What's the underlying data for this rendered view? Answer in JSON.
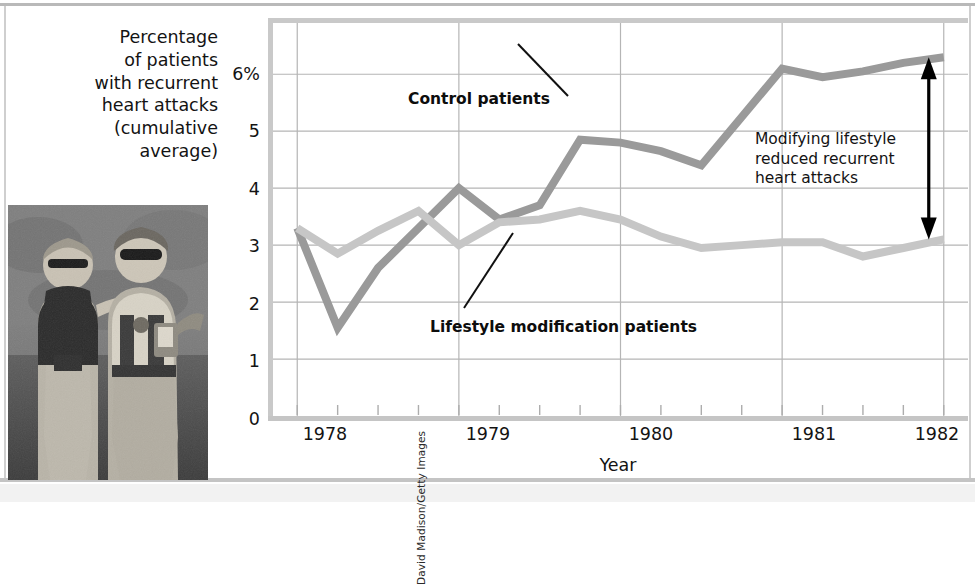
{
  "figure": {
    "photo_credit": "David Madison/Getty Images",
    "photo_alt": "two-anglers-photo"
  },
  "annotations": {
    "control_label": "Control patients",
    "lifestyle_label": "Lifestyle modification patients",
    "callout_line1": "Modifying lifestyle",
    "callout_line2": "reduced recurrent",
    "callout_line3": "heart attacks"
  },
  "ylabel_lines": [
    "Percentage",
    "of patients",
    "with recurrent",
    "heart attacks",
    "(cumulative",
    "average)"
  ],
  "colors": {
    "control_line": "#9a9a9a",
    "lifestyle_line": "#c6c6c6",
    "gridline": "#b5b5b5",
    "axis": "#c6c6c6",
    "text": "#131313",
    "arrow": "#000000"
  },
  "chart_data": {
    "type": "line",
    "title": "",
    "xlabel": "Year",
    "ylabel": "Percentage of patients with recurrent heart attacks (cumulative average)",
    "xlim": [
      1977.85,
      1982.15
    ],
    "ylim": [
      0,
      6.9
    ],
    "ytick_labels": [
      "0",
      "1",
      "2",
      "3",
      "4",
      "5",
      "6%"
    ],
    "ytick_values": [
      0,
      1,
      2,
      3,
      4,
      5,
      6
    ],
    "xtick_labels": [
      "1978",
      "1979",
      "1980",
      "1981",
      "1982"
    ],
    "xtick_values": [
      1978,
      1979,
      1980,
      1981,
      1982
    ],
    "minor_xticks_per_year": 4,
    "grid": "horizontal-and-vertical",
    "legend": "inline-annotations",
    "x": [
      1978.0,
      1978.25,
      1978.5,
      1978.75,
      1979.0,
      1979.25,
      1979.5,
      1979.75,
      1980.0,
      1980.25,
      1980.5,
      1980.75,
      1981.0,
      1981.25,
      1981.5,
      1981.75,
      1982.0
    ],
    "series": [
      {
        "name": "Control patients",
        "color": "#9a9a9a",
        "values": [
          3.3,
          1.55,
          2.6,
          3.3,
          4.0,
          3.45,
          3.7,
          4.85,
          4.8,
          4.65,
          4.4,
          5.25,
          6.1,
          5.95,
          6.05,
          6.2,
          6.3
        ]
      },
      {
        "name": "Lifestyle modification patients",
        "color": "#c6c6c6",
        "values": [
          3.3,
          2.85,
          3.25,
          3.6,
          3.0,
          3.4,
          3.45,
          3.6,
          3.45,
          3.15,
          2.95,
          3.0,
          3.05,
          3.05,
          2.8,
          2.95,
          3.1
        ]
      }
    ],
    "difference_arrow": {
      "x": 1982.0,
      "y_top": 6.3,
      "y_bottom": 3.1,
      "note": "Modifying lifestyle reduced recurrent heart attacks"
    }
  }
}
